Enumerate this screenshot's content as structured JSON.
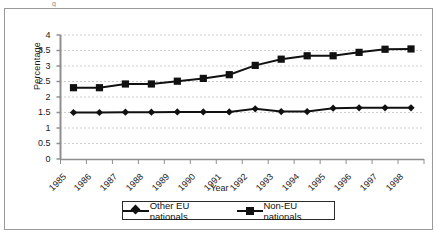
{
  "caption_fragment": "g",
  "chart_data": {
    "type": "line",
    "title": "",
    "xlabel": "Year",
    "ylabel": "Percentage",
    "categories": [
      "1985",
      "1986",
      "1987",
      "1988",
      "1989",
      "1990",
      "1991",
      "1992",
      "1993",
      "1994",
      "1995",
      "1996",
      "1997",
      "1998"
    ],
    "ylim": [
      0,
      4
    ],
    "yticks": [
      "0",
      "0.5",
      "1",
      "1.5",
      "2",
      "2.5",
      "3",
      "3.5",
      "4"
    ],
    "ytick_values": [
      0,
      0.5,
      1,
      1.5,
      2,
      2.5,
      3,
      3.5,
      4
    ],
    "grid": "horizontal-dotted",
    "legend_position": "bottom",
    "series": [
      {
        "name": "Other EU nationals",
        "marker": "diamond",
        "color": "#111111",
        "values": [
          1.5,
          1.5,
          1.51,
          1.51,
          1.52,
          1.52,
          1.52,
          1.62,
          1.53,
          1.53,
          1.64,
          1.65,
          1.65,
          1.65
        ]
      },
      {
        "name": "Non-EU nationals",
        "marker": "square",
        "color": "#111111",
        "values": [
          2.3,
          2.3,
          2.42,
          2.42,
          2.51,
          2.6,
          2.72,
          3.02,
          3.22,
          3.33,
          3.33,
          3.44,
          3.54,
          3.55
        ]
      }
    ]
  },
  "legend": {
    "items": [
      {
        "label": "Other EU nationals",
        "marker": "diamond"
      },
      {
        "label": "Non-EU nationals",
        "marker": "square"
      }
    ]
  }
}
